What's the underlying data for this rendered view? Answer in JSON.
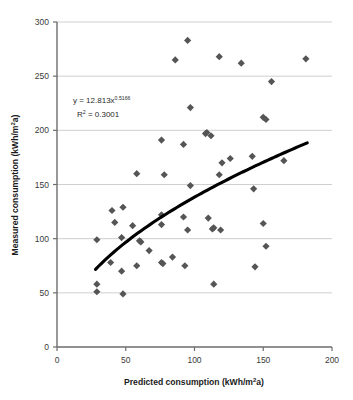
{
  "chart_data": {
    "type": "scatter",
    "title": "",
    "xlabel": "Predicted consumption (kWh/m²a)",
    "ylabel": "Measured consumption (kWh/m²a)",
    "xlim": [
      0,
      200
    ],
    "ylim": [
      0,
      300
    ],
    "xticks": [
      "0",
      "50",
      "100",
      "150",
      "200"
    ],
    "xtick_values": [
      0,
      50,
      100,
      150,
      200
    ],
    "yticks": [
      "0",
      "50",
      "100",
      "150",
      "200",
      "250",
      "300"
    ],
    "ytick_values": [
      0,
      50,
      100,
      150,
      200,
      250,
      300
    ],
    "grid": "horizontal",
    "legend": "none",
    "marker": {
      "shape": "diamond",
      "color": "#555555",
      "size": 6
    },
    "series": [
      {
        "name": "Buildings",
        "points": [
          [
            29,
            99
          ],
          [
            29,
            58
          ],
          [
            29,
            51
          ],
          [
            39,
            78
          ],
          [
            40,
            126
          ],
          [
            42,
            115
          ],
          [
            47,
            101
          ],
          [
            47,
            70
          ],
          [
            48,
            49
          ],
          [
            48,
            129
          ],
          [
            55,
            112
          ],
          [
            58,
            75
          ],
          [
            58,
            160
          ],
          [
            60,
            98
          ],
          [
            61,
            97
          ],
          [
            67,
            89
          ],
          [
            76,
            191
          ],
          [
            76,
            122
          ],
          [
            76,
            113
          ],
          [
            76,
            78
          ],
          [
            77,
            77
          ],
          [
            78,
            159
          ],
          [
            84,
            83
          ],
          [
            86,
            265
          ],
          [
            92,
            187
          ],
          [
            92,
            120
          ],
          [
            93,
            75
          ],
          [
            95,
            283
          ],
          [
            95,
            108
          ],
          [
            97,
            149
          ],
          [
            97,
            221
          ],
          [
            108,
            197
          ],
          [
            109,
            198
          ],
          [
            110,
            119
          ],
          [
            112,
            195
          ],
          [
            113,
            109
          ],
          [
            114,
            110
          ],
          [
            114,
            58
          ],
          [
            118,
            268
          ],
          [
            118,
            159
          ],
          [
            119,
            108
          ],
          [
            120,
            170
          ],
          [
            126,
            174
          ],
          [
            134,
            262
          ],
          [
            142,
            176
          ],
          [
            143,
            146
          ],
          [
            144,
            74
          ],
          [
            150,
            114
          ],
          [
            150,
            212
          ],
          [
            152,
            210
          ],
          [
            152,
            93
          ],
          [
            156,
            245
          ],
          [
            165,
            172
          ],
          [
            181,
            266
          ]
        ]
      }
    ],
    "trendline": {
      "type": "power",
      "equation": "y = 12.813x",
      "exponent": "0.5166",
      "r2_label": "R",
      "r2_sup": "2",
      "r2_value": " = 0.3001",
      "coefficient": 12.813,
      "color": "#000000",
      "x_start": 28,
      "x_end": 182
    },
    "annotation": {
      "line1_main": "y = 12.813x",
      "line1_sup": "0.5166",
      "line2_main": "R",
      "line2_sup": "2",
      "line2_rest": " = 0.3001"
    },
    "colors": {
      "marker": "#555555",
      "trendline": "#000000",
      "gridline": "#c9c9c9",
      "axis": "#6d6d6d",
      "text": "#231f20",
      "background": "#ffffff"
    },
    "axis_unit_base": "kWh/m",
    "axis_unit_sup": "2",
    "axis_unit_tail": "a)"
  }
}
